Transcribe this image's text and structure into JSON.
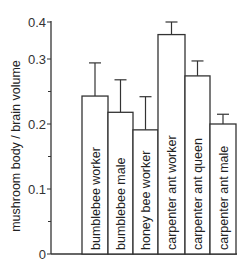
{
  "chart_data": {
    "type": "bar",
    "title": "",
    "xlabel": "",
    "ylabel": "mushroom body / brain volume",
    "categories": [
      "bumblebee worker",
      "bumblebee male",
      "honey bee worker",
      "carpenter ant worker",
      "carpenter ant queen",
      "carpenter ant male"
    ],
    "values": [
      0.243,
      0.218,
      0.191,
      0.366,
      0.274,
      0.2
    ],
    "error_upper": [
      0.294,
      0.268,
      0.242,
      0.4,
      0.297,
      0.215
    ],
    "ylim": [
      0,
      0.4
    ],
    "yticks": [
      0,
      0.1,
      0.2,
      0.3,
      0.4
    ],
    "ytick_labels": [
      "0",
      "0.1",
      "0.2",
      "0.3",
      "0.4"
    ],
    "minor_ticks": [
      0.05,
      0.15,
      0.25
    ],
    "grid": false,
    "legend": null,
    "bar_fill": "#ffffff",
    "bar_stroke": "#333333",
    "note": "Category labels are drawn vertically inside each bar; y-axis is compressed above 0.3"
  }
}
